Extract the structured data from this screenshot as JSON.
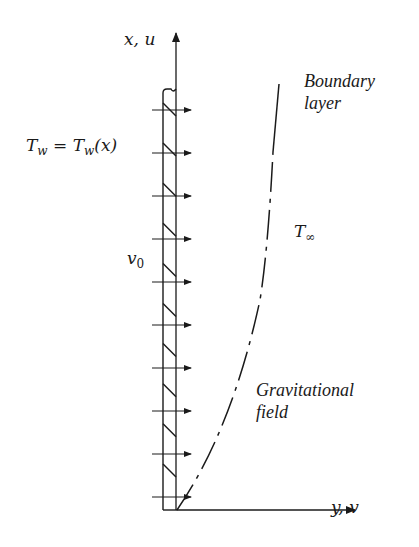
{
  "figure": {
    "axes": {
      "vertical_label": "x, u",
      "horizontal_label": "y, v"
    },
    "labels": {
      "wall_temperature": {
        "lhs": "T",
        "lhs_sub": "w",
        "eq": " = ",
        "rhs": "T",
        "rhs_sub": "w",
        "rhs_arg": "(x)"
      },
      "wall_velocity": {
        "sym": "v",
        "sub": "0"
      },
      "ambient_temperature": {
        "sym": "T",
        "sub": "∞"
      },
      "boundary_layer": {
        "line1": "Boundary",
        "line2": "layer"
      },
      "gravitational_field": {
        "line1": "Gravitational",
        "line2": "field"
      }
    },
    "wall": {
      "x_left": 163,
      "x_right": 176,
      "y_top": 89,
      "y_bottom": 510,
      "hatch_count": 10
    },
    "suction_arrows_y": [
      110,
      153,
      196,
      239,
      282,
      325,
      368,
      411,
      454,
      497
    ],
    "colors": {
      "ink": "#1a1a1a",
      "background": "#ffffff"
    }
  }
}
